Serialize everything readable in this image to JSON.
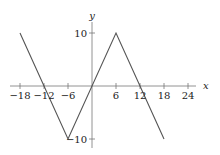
{
  "chart_data": {
    "type": "line",
    "title": "",
    "xlabel": "x",
    "ylabel": "y",
    "xlim": [
      -20,
      26
    ],
    "ylim": [
      -12,
      12
    ],
    "x_ticks": [
      -18,
      -12,
      -6,
      6,
      12,
      18,
      24
    ],
    "x_tick_labels": [
      "−18",
      "−12",
      "−6",
      "6",
      "12",
      "18",
      "24"
    ],
    "y_ticks": [
      10,
      -10
    ],
    "y_tick_labels": [
      "10",
      "−10"
    ],
    "grid": false,
    "legend": null,
    "series": [
      {
        "name": "piecewise",
        "x": [
          -18,
          -6,
          6,
          18
        ],
        "y": [
          10,
          -10,
          10,
          -10
        ]
      }
    ]
  },
  "colors": {
    "axis": "#777777",
    "line": "#555555",
    "text": "#222222"
  }
}
